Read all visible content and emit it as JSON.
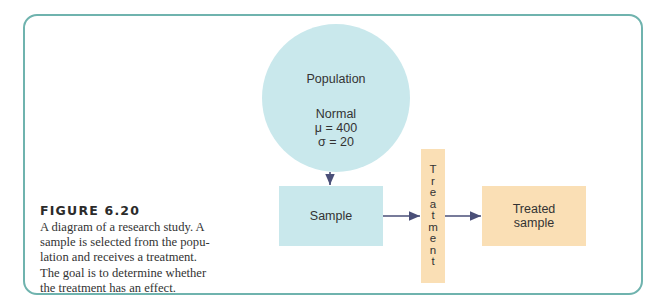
{
  "figure": {
    "label": "FIGURE 6.20",
    "caption_lines": [
      "A diagram of a research study. A",
      "sample is selected from the popu-",
      "lation and receives a treatment.",
      "The goal is to determine whether",
      "the treatment has an effect."
    ]
  },
  "diagram": {
    "population": {
      "title": "Population",
      "distribution": "Normal",
      "mean": "μ = 400",
      "sd": "σ = 20",
      "color": "#c9e8ec"
    },
    "sample": {
      "label": "Sample",
      "color": "#c9e8ec"
    },
    "treatment": {
      "label": "Treatment",
      "letters": [
        "T",
        "r",
        "e",
        "a",
        "t",
        "m",
        "e",
        "n",
        "t"
      ],
      "color": "#fadfb5"
    },
    "treated_sample": {
      "line1": "Treated",
      "line2": "sample",
      "color": "#fadfb5"
    },
    "arrow_color": "#4a4f78",
    "frame_color": "#6fb3ae"
  }
}
